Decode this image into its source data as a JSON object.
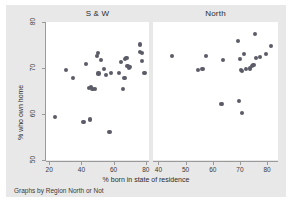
{
  "figure": {
    "background_color": "#e8e8e8",
    "panel_color": "#ffffff",
    "point_color": "#5c5c68",
    "axis_color": "#9a9a9a",
    "caption": "Graphs by Region North or Not",
    "xlabel": "% born in state of residence",
    "ylabel": "% who own home"
  },
  "chart_data": {
    "type": "scatter",
    "title": "",
    "xlabel": "% born in state of residence",
    "ylabel": "% who own home",
    "caption": "Graphs by Region North or Not",
    "grid": false,
    "legend": "none",
    "ylim": [
      50,
      80
    ],
    "yticks": [
      50,
      60,
      70,
      80
    ],
    "panels": [
      {
        "label": "S & W",
        "xlim": [
          18,
          82
        ],
        "xticks": [
          20,
          40,
          60,
          80
        ],
        "points": [
          {
            "x": 23.5,
            "y": 59.4
          },
          {
            "x": 30.3,
            "y": 69.6
          },
          {
            "x": 34.6,
            "y": 67.9
          },
          {
            "x": 41.3,
            "y": 58.2
          },
          {
            "x": 43.1,
            "y": 70.8
          },
          {
            "x": 44.6,
            "y": 65.6
          },
          {
            "x": 45.4,
            "y": 58.8
          },
          {
            "x": 46.2,
            "y": 65.9
          },
          {
            "x": 46.9,
            "y": 65.4
          },
          {
            "x": 48.2,
            "y": 65.4
          },
          {
            "x": 49.6,
            "y": 72.6
          },
          {
            "x": 50.4,
            "y": 73.2
          },
          {
            "x": 50.6,
            "y": 68.8
          },
          {
            "x": 52.0,
            "y": 71.7
          },
          {
            "x": 54.0,
            "y": 69.8
          },
          {
            "x": 55.4,
            "y": 68.5
          },
          {
            "x": 57.4,
            "y": 56.1
          },
          {
            "x": 58.6,
            "y": 68.9
          },
          {
            "x": 63.6,
            "y": 68.9
          },
          {
            "x": 64.6,
            "y": 71.3
          },
          {
            "x": 65.9,
            "y": 65.4
          },
          {
            "x": 66.8,
            "y": 67.8
          },
          {
            "x": 67.2,
            "y": 71.9
          },
          {
            "x": 68.0,
            "y": 72.2
          },
          {
            "x": 68.6,
            "y": 70.5
          },
          {
            "x": 69.4,
            "y": 70.1
          },
          {
            "x": 70.2,
            "y": 70.3
          },
          {
            "x": 76.3,
            "y": 75.1
          },
          {
            "x": 76.6,
            "y": 73.5
          },
          {
            "x": 77.4,
            "y": 73.2
          },
          {
            "x": 77.8,
            "y": 71.6
          },
          {
            "x": 79.2,
            "y": 68.9
          }
        ]
      },
      {
        "label": "North",
        "xlim": [
          38,
          84
        ],
        "xticks": [
          40,
          50,
          60,
          70,
          80
        ],
        "points": [
          {
            "x": 45.0,
            "y": 72.6
          },
          {
            "x": 54.7,
            "y": 69.5
          },
          {
            "x": 56.2,
            "y": 69.7
          },
          {
            "x": 57.5,
            "y": 72.6
          },
          {
            "x": 63.2,
            "y": 62.2
          },
          {
            "x": 63.8,
            "y": 71.7
          },
          {
            "x": 69.3,
            "y": 75.8
          },
          {
            "x": 69.5,
            "y": 62.9
          },
          {
            "x": 70.0,
            "y": 71.9
          },
          {
            "x": 70.4,
            "y": 69.6
          },
          {
            "x": 70.8,
            "y": 69.4
          },
          {
            "x": 70.9,
            "y": 60.3
          },
          {
            "x": 71.6,
            "y": 73.0
          },
          {
            "x": 72.3,
            "y": 69.8
          },
          {
            "x": 73.7,
            "y": 69.9
          },
          {
            "x": 74.3,
            "y": 70.4
          },
          {
            "x": 75.0,
            "y": 70.6
          },
          {
            "x": 75.6,
            "y": 77.4
          },
          {
            "x": 75.8,
            "y": 72.1
          },
          {
            "x": 77.3,
            "y": 72.4
          },
          {
            "x": 79.6,
            "y": 73.0
          },
          {
            "x": 81.5,
            "y": 74.7
          }
        ]
      }
    ]
  }
}
